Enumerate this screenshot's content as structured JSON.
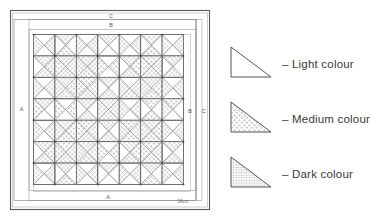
{
  "document": {
    "kind": "quilt-pattern-diagram",
    "title": "Quilt layout diagram with border key"
  },
  "quilt": {
    "border_labels": {
      "outer_top": "C",
      "inner_top": "B",
      "left_side": "A",
      "right_inner": "B",
      "right_outer": "C",
      "bottom": "A"
    },
    "annotation": "34cm",
    "grid": {
      "rows": 7,
      "cols": 7
    },
    "cells": [
      [
        "L,D,L,D",
        "D,L,M,L",
        "L,D,L,D",
        "D,L,L,L",
        "L,D,L,D",
        "D,L,M,L",
        "L,D,L,D"
      ],
      [
        "D,M,D,L",
        "M,D,D,M",
        "D,D,M,D",
        "L,M,L,M",
        "D,M,D,L",
        "M,D,D,M",
        "D,L,D,L"
      ],
      [
        "L,D,L,D",
        "D,M,M,D",
        "M,D,D,M",
        "D,L,D,L",
        "L,D,M,D",
        "D,M,M,D",
        "L,D,L,D"
      ],
      [
        "D,L,L,M",
        "L,M,L,M",
        "D,L,D,L",
        "D,D,D,D",
        "L,D,L,D",
        "M,L,M,L",
        "M,L,L,D"
      ],
      [
        "L,D,L,D",
        "D,M,M,D",
        "M,D,D,M",
        "D,L,D,L",
        "M,D,M,D",
        "D,M,M,D",
        "L,D,L,D"
      ],
      [
        "D,M,D,L",
        "M,D,D,M",
        "D,D,M,D",
        "L,M,L,M",
        "D,M,D,L",
        "M,D,D,M",
        "D,L,D,L"
      ],
      [
        "L,D,L,D",
        "D,L,M,L",
        "L,D,L,D",
        "D,L,L,L",
        "L,D,L,D",
        "D,L,M,L",
        "L,D,L,D"
      ]
    ]
  },
  "legend": {
    "items": [
      {
        "swatch": "light-triangle-swatch",
        "dash": "–",
        "label": "Light colour",
        "fill": "none"
      },
      {
        "swatch": "medium-triangle-swatch",
        "dash": "–",
        "label": "Medium colour",
        "fill": "dots"
      },
      {
        "swatch": "dark-triangle-swatch",
        "dash": "–",
        "label": "Dark colour",
        "fill": "crosshatch"
      }
    ]
  },
  "colors": {
    "ink": "#4a4a4a",
    "ink_light": "#8d8d8d",
    "paper": "#ffffff",
    "medium_shade": "#c9c9c9",
    "dark_shade": "#a8a8a8"
  }
}
